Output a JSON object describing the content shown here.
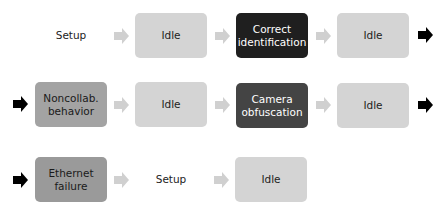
{
  "colors": {
    "idle": "#d4d4d4",
    "fault_mid": "#a3a3a3",
    "fault_dark": "#444444",
    "correct": "#1f1f1f",
    "arrow_light": "#d0d0d0",
    "arrow_dark": "#000000"
  },
  "rows": [
    {
      "nodes": [
        {
          "label": "Setup",
          "style": "plain"
        },
        {
          "label": "Idle",
          "style": "idle"
        },
        {
          "label": "Correct identification",
          "style": "correct"
        },
        {
          "label": "Idle",
          "style": "idle"
        }
      ],
      "continues": true
    },
    {
      "nodes": [
        {
          "label": "Noncollab. behavior",
          "style": "fault_mid"
        },
        {
          "label": "Idle",
          "style": "idle"
        },
        {
          "label": "Camera obfuscation",
          "style": "fault_dark"
        },
        {
          "label": "Idle",
          "style": "idle"
        }
      ],
      "continues": true
    },
    {
      "nodes": [
        {
          "label": "Ethernet failure",
          "style": "fault_mid"
        },
        {
          "label": "Setup",
          "style": "plain"
        },
        {
          "label": "Idle",
          "style": "idle"
        }
      ],
      "continues": false
    }
  ]
}
